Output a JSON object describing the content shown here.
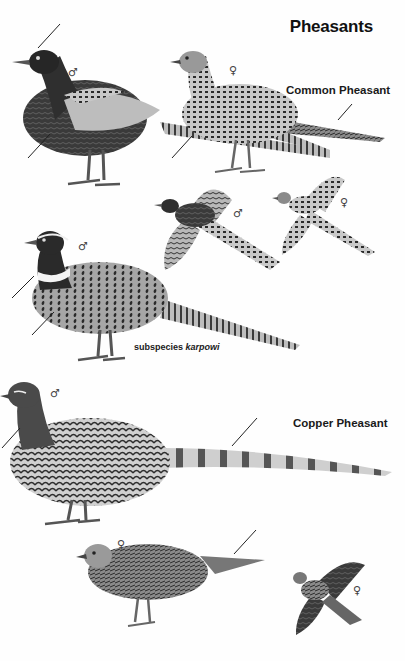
{
  "plate": {
    "title": "Pheasants",
    "species": [
      {
        "name": "Common Pheasant",
        "figures": [
          {
            "id": "common-male-dark-standing",
            "sex_symbol": "♂"
          },
          {
            "id": "common-female-standing",
            "sex_symbol": "♀"
          },
          {
            "id": "common-male-flying",
            "sex_symbol": "♂"
          },
          {
            "id": "common-female-flying",
            "sex_symbol": "♀"
          },
          {
            "id": "common-male-karpowi-standing",
            "sex_symbol": "♂",
            "caption_prefix": "subspecies",
            "caption_name": "karpowi"
          }
        ]
      },
      {
        "name": "Copper Pheasant",
        "figures": [
          {
            "id": "copper-male-standing",
            "sex_symbol": "♂"
          },
          {
            "id": "copper-female-standing",
            "sex_symbol": "♀"
          },
          {
            "id": "copper-female-flying",
            "sex_symbol": "♀"
          }
        ]
      }
    ]
  }
}
